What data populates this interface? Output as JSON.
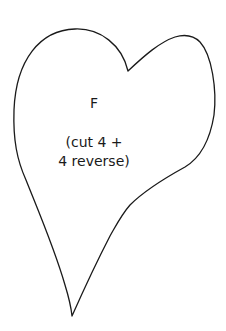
{
  "pattern": {
    "piece_letter": "F",
    "instruction_line1": "(cut 4 +",
    "instruction_line2": "4 reverse)",
    "shape": "heart",
    "outline_color": "#1a1a1a",
    "fill_color": "#ffffff"
  }
}
